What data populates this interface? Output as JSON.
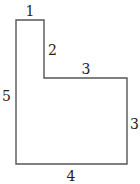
{
  "diagram": {
    "type": "rectilinear-polygon",
    "stroke_color": "#555555",
    "label_color": "#222222",
    "background": "#ffffff",
    "shape_points": "16,20 44,20 44,78 127,78 127,164 16,164",
    "edges": [
      {
        "id": "top",
        "label": "1"
      },
      {
        "id": "inner-vertical",
        "label": "2"
      },
      {
        "id": "step-horizontal",
        "label": "3"
      },
      {
        "id": "right",
        "label": "3"
      },
      {
        "id": "bottom",
        "label": "4"
      },
      {
        "id": "left",
        "label": "5"
      }
    ]
  }
}
